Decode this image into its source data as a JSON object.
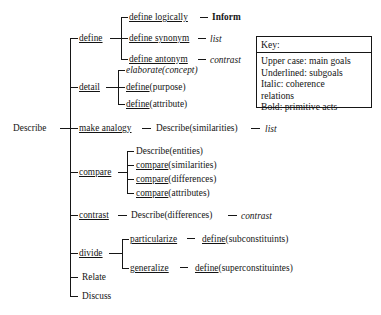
{
  "figure": {
    "type": "tree-diagram",
    "root": "Describe",
    "background_color": "#ffffff",
    "line_color": "#161616",
    "text_color": "#141414"
  },
  "root": {
    "label": "Describe",
    "style": "upper-case-main-goal"
  },
  "branches": [
    {
      "id": "define",
      "label": "define",
      "style": "underlined",
      "children": [
        {
          "label_main": "define logically",
          "style_main": "underlined",
          "relation": "Inform",
          "relation_style": "bold"
        },
        {
          "label_main": "define synonym",
          "style_main": "underlined",
          "relation": "list",
          "relation_style": "italic"
        },
        {
          "label_main": "define antonym",
          "style_main": "underlined",
          "relation": "contrast",
          "relation_style": "italic"
        }
      ]
    },
    {
      "id": "detail",
      "label": "detail",
      "style": "underlined",
      "children": [
        {
          "label_main": "elaborate(concept)",
          "style_main": "italic",
          "relation": "",
          "relation_style": ""
        },
        {
          "label_main": "define",
          "label_tail": "(purpose)",
          "style_main": "underlined",
          "relation": "",
          "relation_style": ""
        },
        {
          "label_main": "define",
          "label_tail": "(attribute)",
          "style_main": "underlined",
          "relation": "",
          "relation_style": ""
        }
      ]
    },
    {
      "id": "make-analogy",
      "label": "make analogy",
      "style": "underlined",
      "inline_chain": [
        {
          "text": "Describe(similarities)",
          "style": "upper-case-main-goal"
        },
        {
          "text": "list",
          "style": "italic"
        }
      ]
    },
    {
      "id": "compare",
      "label": "compare",
      "style": "underlined",
      "children": [
        {
          "label_main": "Describe(entities)",
          "style_main": "plain",
          "relation": "",
          "relation_style": ""
        },
        {
          "label_main": "compare",
          "label_tail": "(similarities)",
          "style_main": "underlined",
          "relation": "",
          "relation_style": ""
        },
        {
          "label_main": "compare",
          "label_tail": "(differences)",
          "style_main": "underlined",
          "relation": "",
          "relation_style": ""
        },
        {
          "label_main": "compare",
          "label_tail": "(attributes)",
          "style_main": "underlined",
          "relation": "",
          "relation_style": ""
        }
      ]
    },
    {
      "id": "contrast",
      "label": "contrast",
      "style": "underlined",
      "inline_chain": [
        {
          "text": "Describe(differences)",
          "style": "upper-case-main-goal"
        },
        {
          "text": "contrast",
          "style": "italic"
        }
      ]
    },
    {
      "id": "divide",
      "label": "divide",
      "style": "underlined",
      "children": [
        {
          "label_main": "particularize",
          "style_main": "underlined",
          "relation_main": "define",
          "relation_tail": "(subconstituints)",
          "relation_style": "underlined"
        },
        {
          "label_main": "generalize",
          "style_main": "underlined",
          "relation_main": "define",
          "relation_tail": "(superconstituintes)",
          "relation_style": "underlined"
        }
      ]
    },
    {
      "id": "relate",
      "label": "Relate",
      "style": "upper-case-main-goal",
      "children": []
    },
    {
      "id": "discuss",
      "label": "Discuss",
      "style": "upper-case-main-goal",
      "children": []
    }
  ],
  "key": {
    "title": "Key:",
    "lines": [
      "Upper case: main goals",
      "Underlined: subgoals",
      "Italic: coherence",
      "relations",
      "Bold: primitive acts"
    ]
  }
}
